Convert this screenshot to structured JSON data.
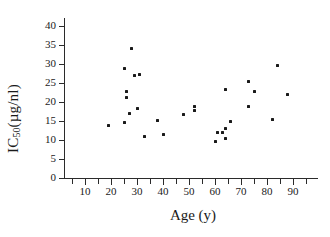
{
  "chart_data": {
    "type": "scatter",
    "title": "",
    "xlabel": "Age (y)",
    "ylabel": "IC50 (µg/nl)",
    "ylabel_base": "IC",
    "ylabel_sub": "50",
    "ylabel_units": " (µg/nl)",
    "xlim": [
      0,
      97
    ],
    "ylim": [
      0,
      42
    ],
    "grid": false,
    "legend": null,
    "x_major_ticks": [
      10,
      20,
      30,
      40,
      50,
      60,
      70,
      80,
      90
    ],
    "x_minor_ticks": [
      5,
      15,
      25,
      35,
      45,
      55,
      65,
      75,
      85,
      95
    ],
    "x_tick_labels": [
      "10",
      "20",
      "30",
      "40",
      "50",
      "60",
      "70",
      "80",
      "90"
    ],
    "y_ticks": [
      0,
      5,
      10,
      15,
      20,
      25,
      30,
      35,
      40
    ],
    "y_tick_labels": [
      "0",
      "5",
      "10",
      "15",
      "20",
      "25",
      "30",
      "35",
      "40"
    ],
    "marker": "square-dot",
    "marker_color": "#1a1a1a",
    "points": [
      {
        "x": 19,
        "y": 13.8
      },
      {
        "x": 25,
        "y": 14.7
      },
      {
        "x": 25,
        "y": 28.9
      },
      {
        "x": 26,
        "y": 21.2
      },
      {
        "x": 26,
        "y": 22.8
      },
      {
        "x": 27,
        "y": 16.9
      },
      {
        "x": 28,
        "y": 34.2
      },
      {
        "x": 29,
        "y": 27.1
      },
      {
        "x": 30,
        "y": 18.2
      },
      {
        "x": 31,
        "y": 27.2
      },
      {
        "x": 33,
        "y": 10.8
      },
      {
        "x": 38,
        "y": 15.1
      },
      {
        "x": 40,
        "y": 11.5
      },
      {
        "x": 48,
        "y": 16.6
      },
      {
        "x": 52,
        "y": 18.9
      },
      {
        "x": 52,
        "y": 17.7
      },
      {
        "x": 60,
        "y": 9.6
      },
      {
        "x": 61,
        "y": 11.9
      },
      {
        "x": 63,
        "y": 12.0
      },
      {
        "x": 64,
        "y": 13.1
      },
      {
        "x": 64,
        "y": 10.5
      },
      {
        "x": 64,
        "y": 23.4
      },
      {
        "x": 66,
        "y": 14.9
      },
      {
        "x": 73,
        "y": 25.5
      },
      {
        "x": 73,
        "y": 18.9
      },
      {
        "x": 75,
        "y": 22.8
      },
      {
        "x": 82,
        "y": 15.4
      },
      {
        "x": 84,
        "y": 29.5
      },
      {
        "x": 88,
        "y": 22.0
      }
    ]
  }
}
